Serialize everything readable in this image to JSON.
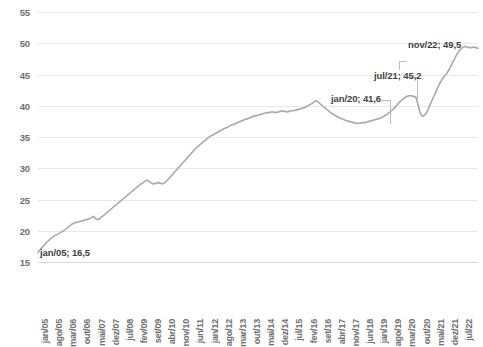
{
  "chart_data": {
    "type": "line",
    "title": "",
    "subtitle": "",
    "xlabel": "",
    "ylabel": "",
    "ylim": [
      15,
      55
    ],
    "y_ticks": [
      15,
      20,
      25,
      30,
      35,
      40,
      45,
      50,
      55
    ],
    "grid": true,
    "legend": "none",
    "line_color": "#a9a9a9",
    "series_name": "valor",
    "x_tick_labels": [
      "jan/05",
      "ago/05",
      "mar/06",
      "out/06",
      "mai/07",
      "dez/07",
      "jul/08",
      "fev/09",
      "set/09",
      "abr/10",
      "nov/10",
      "jun/11",
      "jan/12",
      "ago/12",
      "mar/13",
      "out/13",
      "mai/14",
      "dez/14",
      "jul/15",
      "fev/16",
      "set/16",
      "abr/17",
      "nov/17",
      "jun/18",
      "jan/19",
      "ago/19",
      "mar/20",
      "out/20",
      "mai/21",
      "dez/21",
      "jul/22"
    ],
    "x_tick_interval_months": 5,
    "x_start": "jan/05",
    "x_end": "nov/22",
    "annotations": [
      {
        "name": "start-point",
        "label": "jan/05; 16,5",
        "x_label": "jan/05",
        "value": 16.5
      },
      {
        "name": "pre-covid-peak",
        "label": "jan/20; 41,6",
        "x_label": "jan/20",
        "value": 41.6
      },
      {
        "name": "mid-point",
        "label": "jul/21; 45,2",
        "x_label": "jul/21",
        "value": 45.2
      },
      {
        "name": "end-point",
        "label": "nov/22; 49,5",
        "x_label": "nov/22",
        "value": 49.5
      }
    ],
    "values": [
      16.5,
      17.0,
      17.4,
      17.8,
      18.2,
      18.5,
      18.8,
      19.1,
      19.3,
      19.5,
      19.7,
      19.9,
      20.1,
      20.4,
      20.7,
      21.0,
      21.2,
      21.3,
      21.4,
      21.5,
      21.6,
      21.7,
      21.8,
      21.9,
      22.1,
      22.3,
      21.9,
      21.8,
      22.0,
      22.3,
      22.6,
      22.9,
      23.2,
      23.5,
      23.8,
      24.1,
      24.4,
      24.7,
      25.0,
      25.3,
      25.6,
      25.9,
      26.2,
      26.5,
      26.8,
      27.1,
      27.4,
      27.6,
      27.9,
      28.1,
      27.9,
      27.6,
      27.5,
      27.6,
      27.7,
      27.6,
      27.5,
      27.7,
      28.0,
      28.4,
      28.8,
      29.2,
      29.6,
      30.0,
      30.4,
      30.8,
      31.2,
      31.6,
      32.0,
      32.4,
      32.8,
      33.2,
      33.5,
      33.8,
      34.1,
      34.4,
      34.7,
      35.0,
      35.2,
      35.4,
      35.6,
      35.8,
      36.0,
      36.2,
      36.4,
      36.5,
      36.7,
      36.9,
      37.0,
      37.2,
      37.3,
      37.5,
      37.6,
      37.8,
      37.9,
      38.0,
      38.2,
      38.3,
      38.4,
      38.5,
      38.6,
      38.7,
      38.8,
      38.9,
      38.9,
      39.0,
      39.0,
      38.9,
      39.0,
      39.1,
      39.2,
      39.1,
      39.0,
      39.1,
      39.2,
      39.2,
      39.3,
      39.4,
      39.5,
      39.6,
      39.7,
      39.9,
      40.1,
      40.3,
      40.5,
      40.8,
      40.6,
      40.3,
      40.0,
      39.7,
      39.4,
      39.1,
      38.8,
      38.6,
      38.4,
      38.2,
      38.0,
      37.9,
      37.7,
      37.6,
      37.5,
      37.4,
      37.3,
      37.2,
      37.2,
      37.2,
      37.3,
      37.3,
      37.4,
      37.5,
      37.6,
      37.7,
      37.8,
      37.9,
      38.0,
      38.2,
      38.4,
      38.6,
      38.9,
      39.2,
      39.5,
      39.9,
      40.3,
      40.7,
      41.0,
      41.3,
      41.5,
      41.6,
      41.6,
      41.5,
      41.4,
      40.2,
      38.8,
      38.3,
      38.5,
      39.0,
      39.8,
      40.6,
      41.4,
      42.2,
      43.0,
      43.7,
      44.3,
      44.8,
      45.2,
      45.8,
      46.5,
      47.2,
      47.9,
      48.5,
      49.0,
      49.3,
      49.5,
      49.4,
      49.3,
      49.3,
      49.4,
      49.3,
      49.2
    ]
  }
}
